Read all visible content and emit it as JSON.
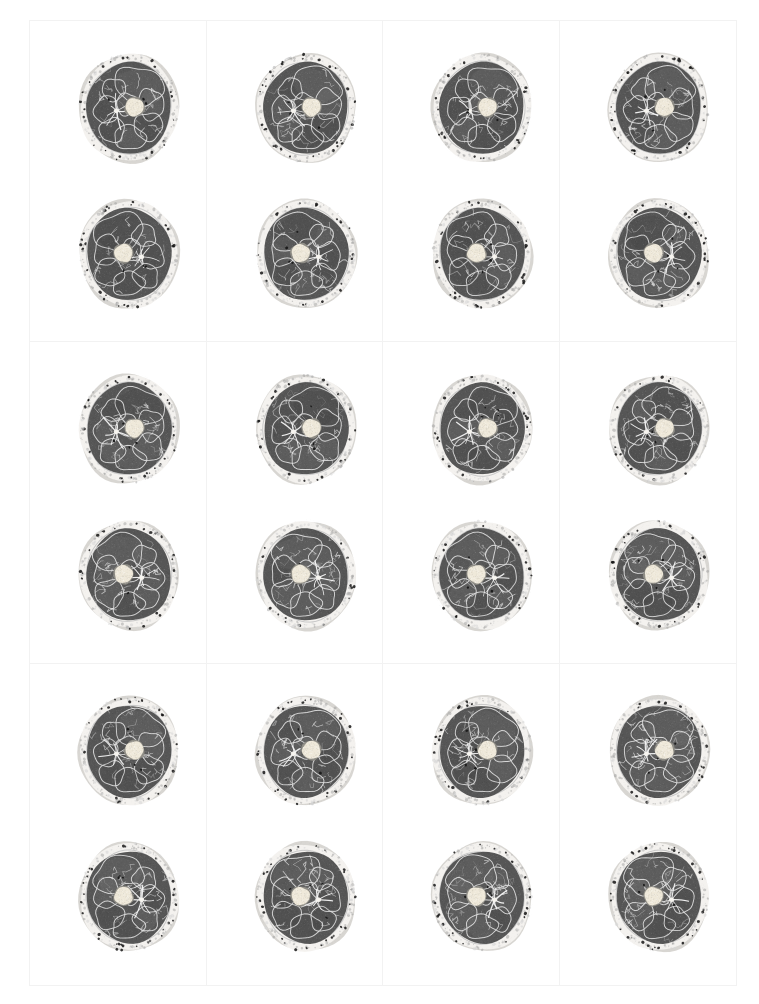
{
  "sheet": {
    "kind": "contact-sheet",
    "orientation": "rotated-90-ccw",
    "columns": 4,
    "rows": 3,
    "background_color": "#ffffff",
    "border_color": "#f2f2f2",
    "label_color": "#262626",
    "images_per_panel": 2,
    "image_subject": "axial-thigh-cross-section",
    "colors": {
      "muscle": "#565656",
      "bone_marrow": "#efe9da",
      "subcutaneous_fat": "#f4f2ef",
      "fascia": "#c9c9c9",
      "skin": "#d8d6d2",
      "vessel": "#1c1c1c"
    },
    "panels": [
      {
        "label": "a_vm2139",
        "bold": false,
        "row": 0,
        "col": 0,
        "seed": 2139
      },
      {
        "label": "a_vm2142",
        "bold": true,
        "row": 0,
        "col": 1,
        "seed": 2142
      },
      {
        "label": "a_vm2145",
        "bold": false,
        "row": 0,
        "col": 2,
        "seed": 2145
      },
      {
        "label": "a_vm2148",
        "bold": false,
        "row": 0,
        "col": 3,
        "seed": 2148
      },
      {
        "label": "a_vm2138",
        "bold": false,
        "row": 1,
        "col": 0,
        "seed": 2138
      },
      {
        "label": "a_vm2141",
        "bold": false,
        "row": 1,
        "col": 1,
        "seed": 2141
      },
      {
        "label": "a_vm2144",
        "bold": false,
        "row": 1,
        "col": 2,
        "seed": 2144
      },
      {
        "label": "a_vm2147",
        "bold": false,
        "row": 1,
        "col": 3,
        "seed": 2147
      },
      {
        "label": "a_vm2137",
        "bold": false,
        "row": 2,
        "col": 0,
        "seed": 2137
      },
      {
        "label": "a_vm2140",
        "bold": false,
        "row": 2,
        "col": 1,
        "seed": 2140
      },
      {
        "label": "a_vm2143",
        "bold": false,
        "row": 2,
        "col": 2,
        "seed": 2143
      },
      {
        "label": "a_vm2146",
        "bold": false,
        "row": 2,
        "col": 3,
        "seed": 2146
      }
    ]
  }
}
